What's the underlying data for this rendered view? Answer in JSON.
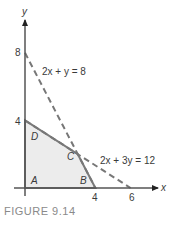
{
  "figure": {
    "caption": "FIGURE 9.14",
    "axis_labels": {
      "x": "x",
      "y": "y"
    },
    "ticks": {
      "x": [
        {
          "value": 4,
          "label": "4"
        },
        {
          "value": 6,
          "label": "6"
        }
      ],
      "y": [
        {
          "value": 4,
          "label": "4"
        },
        {
          "value": 8,
          "label": "8"
        }
      ]
    },
    "lines": [
      {
        "name": "constraint-1",
        "equation": "2x + y = 8",
        "style": "dashed",
        "from": [
          0,
          8
        ],
        "to": [
          4,
          0
        ]
      },
      {
        "name": "constraint-2",
        "equation": "2x + 3y = 12",
        "style": "dashed",
        "from": [
          0,
          4
        ],
        "to": [
          6,
          0
        ]
      }
    ],
    "feasible_region": {
      "vertices": [
        {
          "label": "A",
          "point": [
            0,
            0
          ]
        },
        {
          "label": "B",
          "point": [
            4,
            0
          ]
        },
        {
          "label": "C",
          "point": [
            3,
            2
          ]
        },
        {
          "label": "D",
          "point": [
            0,
            4
          ]
        }
      ],
      "fill_color": "#ececec",
      "edge_color": "#7a7a7a"
    },
    "colors": {
      "axis": "#555555",
      "dashed": "#777777",
      "text": "#3a3a3a"
    }
  },
  "chart_data": {
    "type": "line",
    "title": "FIGURE 9.14",
    "xlabel": "x",
    "ylabel": "y",
    "xlim": [
      0,
      6.5
    ],
    "ylim": [
      0,
      9
    ],
    "x_ticks": [
      4,
      6
    ],
    "y_ticks": [
      4,
      8
    ],
    "grid": false,
    "series": [
      {
        "name": "2x + y = 8",
        "style": "dashed",
        "points": [
          [
            0,
            8
          ],
          [
            4,
            0
          ]
        ]
      },
      {
        "name": "2x + 3y = 12",
        "style": "dashed",
        "points": [
          [
            0,
            4
          ],
          [
            6,
            0
          ]
        ]
      },
      {
        "name": "feasible region",
        "style": "filled polygon",
        "points": [
          [
            0,
            0
          ],
          [
            4,
            0
          ],
          [
            3,
            2
          ],
          [
            0,
            4
          ]
        ]
      }
    ],
    "annotations": [
      {
        "text": "A",
        "at": [
          0,
          0
        ]
      },
      {
        "text": "B",
        "at": [
          4,
          0
        ]
      },
      {
        "text": "C",
        "at": [
          3,
          2
        ]
      },
      {
        "text": "D",
        "at": [
          0,
          4
        ]
      },
      {
        "text": "2x + y = 8",
        "near": [
          2,
          6
        ]
      },
      {
        "text": "2x + 3y = 12",
        "near": [
          5,
          1.3
        ]
      }
    ]
  }
}
